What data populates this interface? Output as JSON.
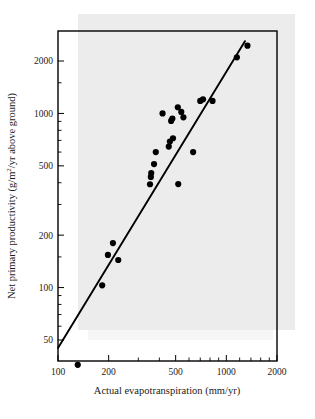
{
  "figure": {
    "background_color": "#ffffff",
    "ink_color": "#000000",
    "scan_tint_color": "#e6e6e6"
  },
  "chart_data": {
    "type": "scatter",
    "title": "",
    "xlabel": "Actual evapotranspiration (mm/yr)",
    "ylabel": "Net primary productivity (g/m²/yr above ground)",
    "ylabel_parts": {
      "prefix": "Net primary productivity (g/m",
      "superscript": "2",
      "suffix": "/yr above ground)"
    },
    "xscale": "log",
    "yscale": "log",
    "xlim": [
      100,
      2000
    ],
    "ylim": [
      30,
      2600
    ],
    "grid": false,
    "legend": null,
    "xticks": [
      100,
      200,
      500,
      1000,
      2000
    ],
    "xtick_labels": [
      "100",
      "200",
      "500",
      "1000",
      "2000"
    ],
    "yticks": [
      50,
      100,
      200,
      500,
      1000,
      2000
    ],
    "ytick_labels": [
      "50",
      "100",
      "200",
      "500",
      "1000",
      "2000"
    ],
    "xminor_ticks": [
      300,
      400,
      600,
      700,
      800,
      900,
      1200,
      1400,
      1600,
      1800
    ],
    "yminor_ticks": [
      60,
      70,
      80,
      90,
      150,
      300,
      400,
      600,
      700,
      800,
      900,
      1500
    ],
    "marker": "filled-circle",
    "marker_size_px": 4.2,
    "points": [
      {
        "x": 131,
        "y": 36
      },
      {
        "x": 183,
        "y": 103
      },
      {
        "x": 198,
        "y": 154
      },
      {
        "x": 212,
        "y": 180
      },
      {
        "x": 228,
        "y": 144
      },
      {
        "x": 352,
        "y": 392
      },
      {
        "x": 356,
        "y": 432
      },
      {
        "x": 358,
        "y": 455
      },
      {
        "x": 372,
        "y": 512
      },
      {
        "x": 381,
        "y": 600
      },
      {
        "x": 418,
        "y": 1000
      },
      {
        "x": 455,
        "y": 645
      },
      {
        "x": 462,
        "y": 690
      },
      {
        "x": 470,
        "y": 905
      },
      {
        "x": 478,
        "y": 935
      },
      {
        "x": 482,
        "y": 720
      },
      {
        "x": 515,
        "y": 1085
      },
      {
        "x": 518,
        "y": 393
      },
      {
        "x": 540,
        "y": 1020
      },
      {
        "x": 556,
        "y": 950
      },
      {
        "x": 635,
        "y": 600
      },
      {
        "x": 700,
        "y": 1180
      },
      {
        "x": 727,
        "y": 1205
      },
      {
        "x": 828,
        "y": 1180
      },
      {
        "x": 1155,
        "y": 2100
      },
      {
        "x": 1335,
        "y": 2450
      }
    ],
    "fit_line": {
      "label": "regression line",
      "x_start": 100,
      "y_start": 45,
      "x_end": 1290,
      "y_end": 2600
    },
    "n_points": 26
  }
}
